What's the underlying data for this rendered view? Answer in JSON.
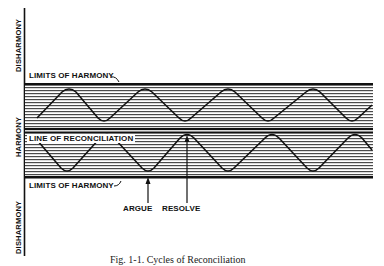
{
  "figure": {
    "axis_labels": {
      "top": "DISHARMONY",
      "middle": "HARMONY",
      "bottom": "DISHARMONY"
    },
    "lines": {
      "upper_limit": "LIMITS OF HARMONY",
      "center": "LINE OF RECONCILIATION",
      "lower_limit": "LIMITS OF HARMONY"
    },
    "annotations": {
      "argue": "ARGUE",
      "resolve": "RESOLVE"
    },
    "caption": "Fig. 1-1. Cycles of Reconciliation",
    "colors": {
      "ink": "#111111",
      "hatch": "#555555",
      "background": "#ffffff"
    }
  }
}
